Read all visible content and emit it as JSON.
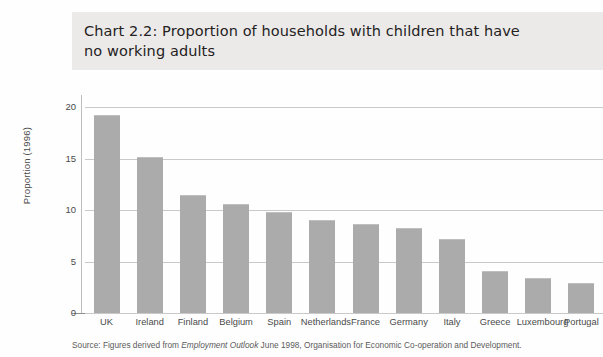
{
  "chart_data": {
    "type": "bar",
    "title": "Chart 2.2: Proportion of households with children that have\nno working adults",
    "subtitle": "",
    "xlabel": "",
    "ylabel": "Proportion (1996)",
    "ylim": [
      0,
      20
    ],
    "yticks": [
      "0",
      "5",
      "10",
      "15",
      "20"
    ],
    "grid": true,
    "legend": "none",
    "categories": [
      "UK",
      "Ireland",
      "Finland",
      "Belgium",
      "Spain",
      "Netherlands",
      "France",
      "Germany",
      "Italy",
      "Greece",
      "Luxembourg",
      "Portugal"
    ],
    "values": [
      19.2,
      15.1,
      11.5,
      10.6,
      9.8,
      9.0,
      8.6,
      8.3,
      7.2,
      4.1,
      3.4,
      2.9
    ],
    "bar_color": "#ababab",
    "gridline_color": "#c9c9c9",
    "banner_color": "#eceae8",
    "axis_color": "#8e8e8e"
  },
  "source": {
    "prefix": "Source: Figures derived from ",
    "italic": "Employment Outlook",
    "suffix": " June 1998, Organisation for Economic Co-operation and Development."
  }
}
